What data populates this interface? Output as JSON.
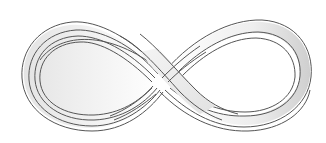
{
  "figure": {
    "description": "Infinity symbol drawn as a twisted ribbon (Möbius-style strip)",
    "colors": {
      "background": "#ffffff",
      "outline": "#555555",
      "ribbon_fill": "#ffffff",
      "ribbon_shade": "#d9d9d9"
    }
  }
}
